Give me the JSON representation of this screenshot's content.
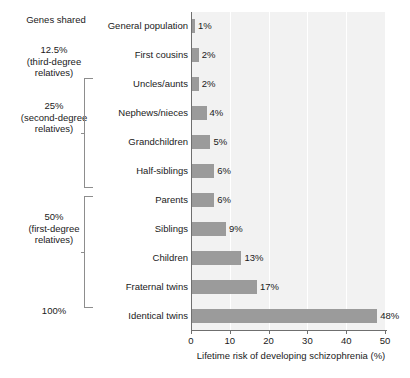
{
  "chart_data": {
    "type": "bar",
    "orientation": "horizontal",
    "title": "",
    "xlabel": "Lifetime risk of developing schizophrenia (%)",
    "ylabel": "",
    "categories": [
      "General population",
      "First cousins",
      "Uncles/aunts",
      "Nephews/nieces",
      "Grandchildren",
      "Half-siblings",
      "Parents",
      "Siblings",
      "Children",
      "Fraternal twins",
      "Identical twins"
    ],
    "values": [
      1,
      2,
      2,
      4,
      5,
      6,
      6,
      9,
      13,
      17,
      48
    ],
    "value_labels": [
      "1%",
      "2%",
      "2%",
      "4%",
      "5%",
      "6%",
      "6%",
      "9%",
      "13%",
      "17%",
      "48%"
    ],
    "xlim": [
      0,
      50
    ],
    "xticks": [
      0,
      10,
      20,
      30,
      40,
      50
    ],
    "xtick_labels": [
      "0",
      "10",
      "20",
      "30",
      "40",
      "50"
    ],
    "grid": "vertical-white",
    "legend": "none",
    "bar_color": "#9b9b9b",
    "plot_background": "#f2f2f2"
  },
  "genes_column": {
    "heading": "Genes shared",
    "groups": [
      {
        "id": "third-degree",
        "lines": [
          "12.5%",
          "(third-degree",
          "relatives)"
        ],
        "bracket": false
      },
      {
        "id": "second-degree",
        "lines": [
          "25%",
          "(second-degree",
          "relatives)"
        ],
        "bracket": true
      },
      {
        "id": "first-degree",
        "lines": [
          "50%",
          "(first-degree",
          "relatives)"
        ],
        "bracket": true
      },
      {
        "id": "identical",
        "lines": [
          "100%"
        ],
        "bracket": false
      }
    ]
  }
}
